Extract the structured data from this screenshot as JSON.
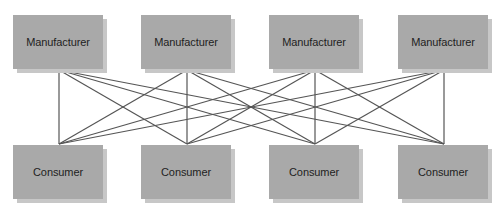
{
  "diagram": {
    "colors": {
      "box_fill": "#a9a9a9",
      "box_shadow": "#c7c7c7",
      "line": "#555555",
      "text": "#1e1e1e",
      "background": "#ffffff"
    },
    "manufacturers": [
      {
        "label": "Manufacturer",
        "x": 13,
        "y": 15,
        "anchor_x": 59,
        "anchor_y": 70
      },
      {
        "label": "Manufacturer",
        "x": 141,
        "y": 15,
        "anchor_x": 187,
        "anchor_y": 70
      },
      {
        "label": "Manufacturer",
        "x": 269,
        "y": 15,
        "anchor_x": 315,
        "anchor_y": 70
      },
      {
        "label": "Manufacturer",
        "x": 398,
        "y": 15,
        "anchor_x": 444,
        "anchor_y": 70
      }
    ],
    "consumers": [
      {
        "label": "Consumer",
        "x": 13,
        "y": 145,
        "anchor_x": 59,
        "anchor_y": 144
      },
      {
        "label": "Consumer",
        "x": 141,
        "y": 145,
        "anchor_x": 187,
        "anchor_y": 144
      },
      {
        "label": "Consumer",
        "x": 269,
        "y": 145,
        "anchor_x": 315,
        "anchor_y": 144
      },
      {
        "label": "Consumer",
        "x": 398,
        "y": 145,
        "anchor_x": 444,
        "anchor_y": 144
      }
    ],
    "connections": "every manufacturer connects to every consumer (4x4 = 16 links)"
  }
}
